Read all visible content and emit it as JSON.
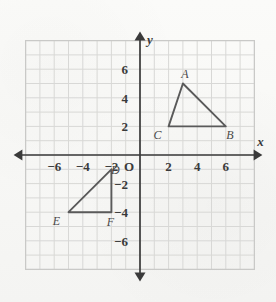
{
  "figure": {
    "background_color": "#f7f7f5",
    "grid_color": "#d8d8d6",
    "axis_color": "#3a3a3a",
    "shape_color": "#5a5a5a"
  },
  "axes": {
    "x_letter": "x",
    "y_letter": "y",
    "origin_label": "O",
    "x_ticks": [
      {
        "value": -6,
        "label": "−6"
      },
      {
        "value": -4,
        "label": "−4"
      },
      {
        "value": -2,
        "label": "−2"
      },
      {
        "value": 2,
        "label": "2"
      },
      {
        "value": 4,
        "label": "4"
      },
      {
        "value": 6,
        "label": "6"
      }
    ],
    "y_ticks": [
      {
        "value": 6,
        "label": "6"
      },
      {
        "value": 4,
        "label": "4"
      },
      {
        "value": 2,
        "label": "2"
      },
      {
        "value": -2,
        "label": "−2"
      },
      {
        "value": -4,
        "label": "−4"
      },
      {
        "value": -6,
        "label": "−6"
      }
    ],
    "x_range": [
      -8,
      8
    ],
    "y_range": [
      -8,
      8
    ],
    "grid": true
  },
  "chart_data": {
    "type": "scatter",
    "title": "",
    "xlabel": "x",
    "ylabel": "y",
    "xlim": [
      -8,
      8
    ],
    "ylim": [
      -8,
      8
    ],
    "grid": true,
    "shapes": [
      {
        "name": "triangle-abc",
        "closed": true,
        "vertices": [
          {
            "label": "A",
            "x": 3,
            "y": 5,
            "label_dx": 2,
            "label_dy": -6
          },
          {
            "label": "B",
            "x": 6,
            "y": 2,
            "label_dx": 4,
            "label_dy": 13
          },
          {
            "label": "C",
            "x": 2,
            "y": 2,
            "label_dx": -11,
            "label_dy": 13
          }
        ]
      },
      {
        "name": "triangle-def",
        "closed": true,
        "vertices": [
          {
            "label": "D",
            "x": -2,
            "y": -1,
            "label_dx": 4,
            "label_dy": 5
          },
          {
            "label": "E",
            "x": -5,
            "y": -4,
            "label_dx": -12,
            "label_dy": 13
          },
          {
            "label": "F",
            "x": -2,
            "y": -4,
            "label_dx": -1,
            "label_dy": 14
          }
        ]
      }
    ]
  }
}
